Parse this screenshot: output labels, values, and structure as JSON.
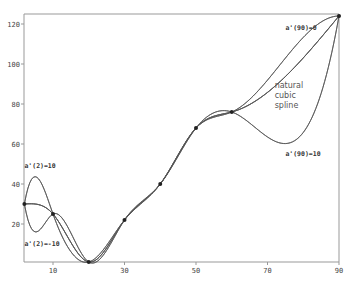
{
  "chart_data": {
    "type": "line",
    "title": "",
    "xlabel": "",
    "ylabel": "",
    "xlim": [
      2,
      90
    ],
    "ylim": [
      0,
      124
    ],
    "grid": false,
    "x_ticks": [
      10,
      30,
      50,
      70,
      90
    ],
    "y_ticks": [
      20,
      40,
      60,
      80,
      100,
      120
    ],
    "knots": {
      "x": [
        2,
        10,
        20,
        30,
        40,
        50,
        60,
        90
      ],
      "y": [
        30,
        25,
        1,
        22,
        40,
        68,
        76,
        124
      ]
    },
    "series": [
      {
        "name": "a'(2)=10, a'(90)=0",
        "left_slope": 10,
        "right_slope": 0
      },
      {
        "name": "natural cubic spline",
        "left_slope": null,
        "right_slope": null
      },
      {
        "name": "a'(2)=-10, a'(90)=10",
        "left_slope": -10,
        "right_slope": 10
      }
    ],
    "annotations": [
      {
        "text": "a'(2)=10",
        "x": 2,
        "y": 48
      },
      {
        "text": "a'(2)=-10",
        "x": 2,
        "y": 9
      },
      {
        "text": "a'(90)=0",
        "x": 75,
        "y": 117
      },
      {
        "text": "natural",
        "x": 72,
        "y": 88
      },
      {
        "text": "cubic",
        "x": 72,
        "y": 83
      },
      {
        "text": "spline",
        "x": 72,
        "y": 78
      },
      {
        "text": "a'(90)=10",
        "x": 75,
        "y": 54
      }
    ]
  }
}
